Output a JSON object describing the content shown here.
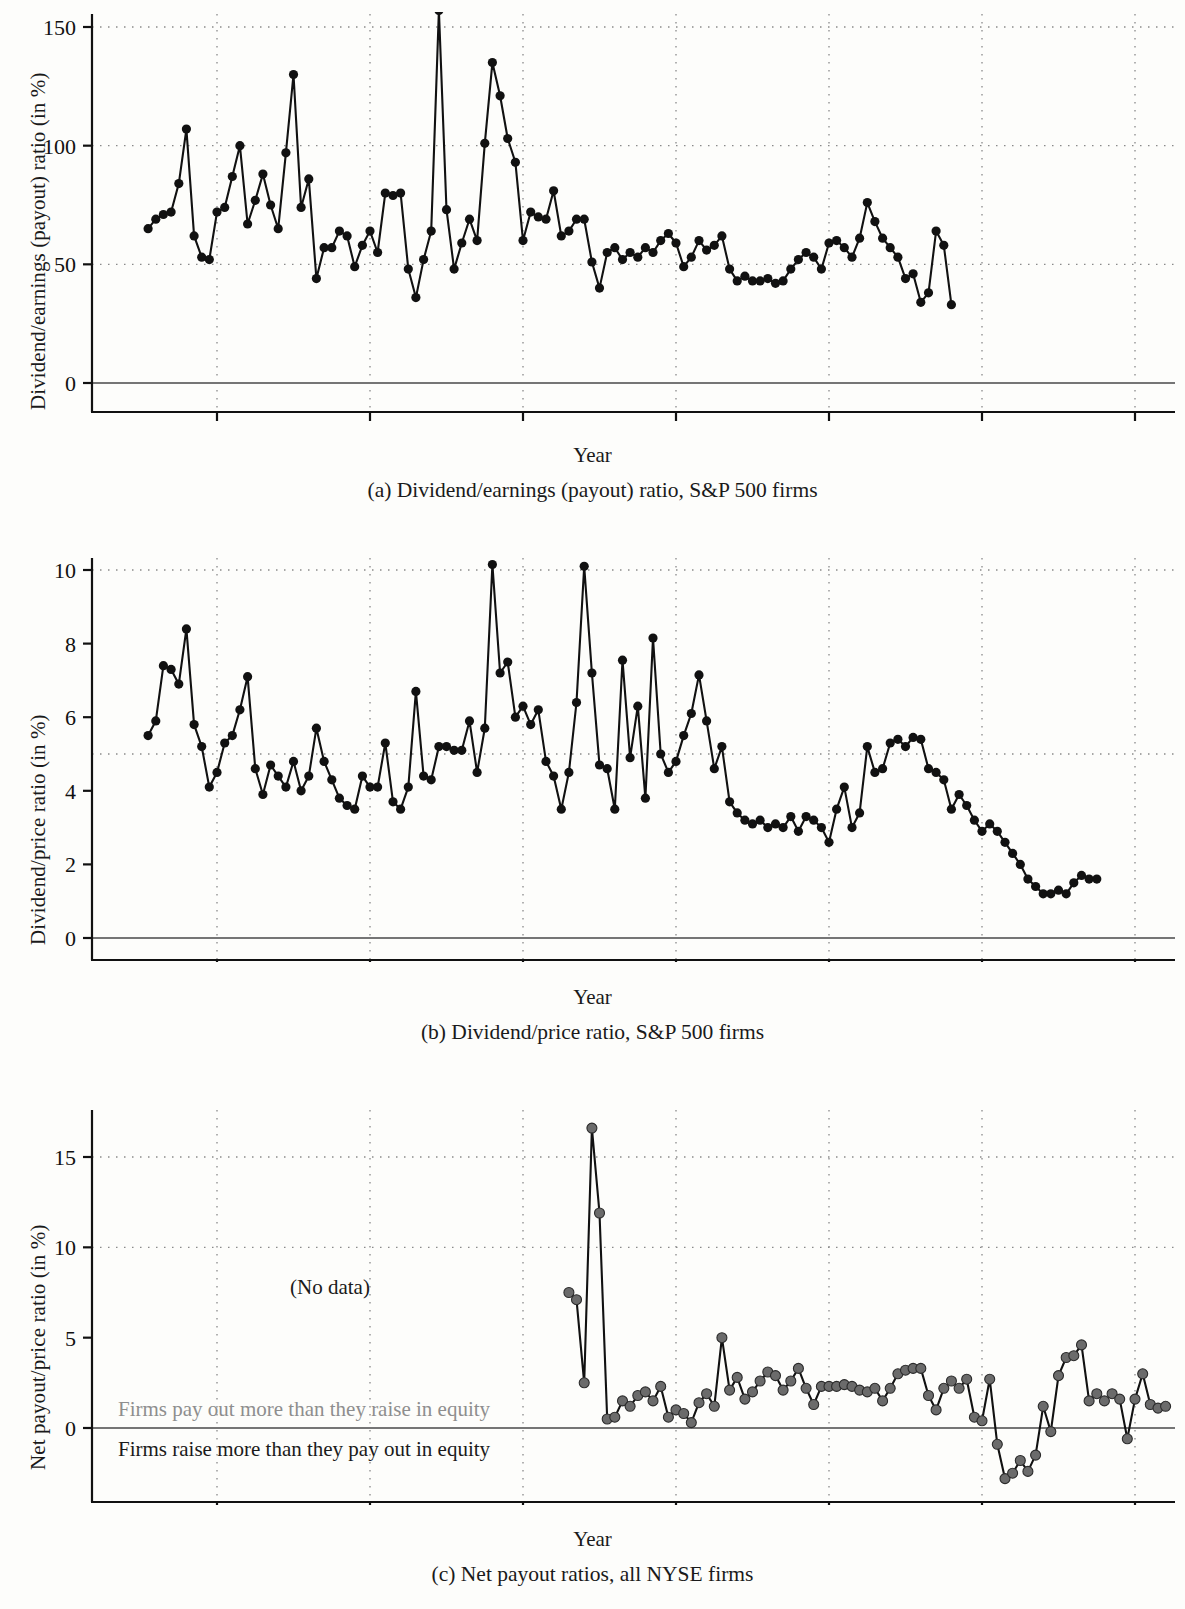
{
  "figure": {
    "panels": [
      {
        "id": "a",
        "caption": "(a) Dividend/earnings (payout) ratio, S&P 500 firms",
        "xlabel": "Year",
        "ylabel": "Dividend/earnings (payout) ratio (in %)"
      },
      {
        "id": "b",
        "caption": "(b) Dividend/price ratio, S&P 500 firms",
        "xlabel": "Year",
        "ylabel": "Dividend/price ratio (in %)"
      },
      {
        "id": "c",
        "caption": "(c) Net payout ratios, all NYSE firms",
        "xlabel": "Year",
        "ylabel": "Net payout/price ratio (in %)",
        "annotations": {
          "no_data": "(No data)",
          "above_zero": "Firms pay out more than they raise in equity",
          "below_zero": "Firms raise more than they pay out in equity"
        }
      }
    ],
    "colors": {
      "line": "#111111",
      "marker_a": "#111111",
      "marker_c": "#6b6b6b",
      "grid": "#8a8a8a",
      "zero_line": "#757575",
      "annotation_grey": "#8e8e8e"
    }
  },
  "chart_data": [
    {
      "type": "line",
      "panel": "a",
      "title": "(a) Dividend/earnings (payout) ratio, S&P 500 firms",
      "xlabel": "Year",
      "ylabel": "Dividend/earnings (payout) ratio (in %)",
      "xlim": [
        1864,
        2007
      ],
      "ylim": [
        -28,
        160
      ],
      "xticks": [
        1880,
        1900,
        1920,
        1940,
        1960,
        1980,
        2000
      ],
      "yticks": [
        0,
        50,
        100,
        150
      ],
      "grid": "dotted-both",
      "legend": "none",
      "markers": true,
      "x": [
        1871,
        1872,
        1873,
        1874,
        1875,
        1876,
        1877,
        1878,
        1879,
        1880,
        1881,
        1882,
        1883,
        1884,
        1885,
        1886,
        1887,
        1888,
        1889,
        1890,
        1891,
        1892,
        1893,
        1894,
        1895,
        1896,
        1897,
        1898,
        1899,
        1900,
        1901,
        1902,
        1903,
        1904,
        1905,
        1906,
        1907,
        1908,
        1909,
        1910,
        1911,
        1912,
        1913,
        1914,
        1915,
        1916,
        1917,
        1918,
        1919,
        1920,
        1921,
        1922,
        1923,
        1924,
        1925,
        1926,
        1927,
        1928,
        1929,
        1930,
        1931,
        1932,
        1933,
        1934,
        1935,
        1936,
        1937,
        1938,
        1939,
        1940,
        1941,
        1942,
        1943,
        1944,
        1945,
        1946,
        1947,
        1948,
        1949,
        1950,
        1951,
        1952,
        1953,
        1954,
        1955,
        1956,
        1957,
        1958,
        1959,
        1960,
        1961,
        1962,
        1963,
        1964,
        1965,
        1966,
        1967,
        1968,
        1969,
        1970,
        1971,
        1972,
        1973,
        1974,
        1975,
        1976,
        1977,
        1978,
        1979,
        1980,
        1981,
        1982,
        1983,
        1984,
        1985,
        1986,
        1987,
        1988,
        1989,
        1990,
        1991,
        1992,
        1993,
        1994,
        1995,
        1996,
        1997,
        1998,
        1999,
        2000,
        2001,
        2002,
        2003,
        2004,
        2005
      ],
      "values": [
        65,
        69,
        71,
        72,
        84,
        107,
        62,
        53,
        52,
        72,
        74,
        87,
        100,
        67,
        77,
        88,
        75,
        65,
        97,
        130,
        74,
        86,
        44,
        57,
        57,
        64,
        62,
        49,
        58,
        64,
        55,
        80,
        79,
        80,
        48,
        36,
        52,
        64,
        157,
        73,
        48,
        59,
        69,
        60,
        101,
        135,
        121,
        103,
        93,
        60,
        72,
        70,
        69,
        81,
        62,
        64,
        69,
        69,
        51,
        40,
        55,
        57,
        52,
        55,
        53,
        57,
        55,
        60,
        63,
        59,
        49,
        53,
        60,
        56,
        58,
        62,
        48,
        43,
        45,
        43,
        43,
        44,
        42,
        43,
        48,
        52,
        55,
        53,
        48,
        59,
        60,
        57,
        53,
        61,
        76,
        68,
        61,
        57,
        53,
        44,
        46,
        34,
        38,
        64,
        58,
        33
      ],
      "note": "Annual series; peak ~157 in 1909 region of plot and ~135 near 1918"
    },
    {
      "type": "line",
      "panel": "b",
      "title": "(b) Dividend/price ratio, S&P 500 firms",
      "xlabel": "Year",
      "ylabel": "Dividend/price ratio (in %)",
      "xlim": [
        1864,
        2007
      ],
      "ylim": [
        -1.7,
        10.6
      ],
      "xticks": [
        1880,
        1900,
        1920,
        1940,
        1960,
        1980,
        2000
      ],
      "yticks": [
        0,
        2,
        4,
        6,
        8,
        10
      ],
      "grid": "dotted-both",
      "legend": "none",
      "markers": true,
      "x": [
        1871,
        1872,
        1873,
        1874,
        1875,
        1876,
        1877,
        1878,
        1879,
        1880,
        1881,
        1882,
        1883,
        1884,
        1885,
        1886,
        1887,
        1888,
        1889,
        1890,
        1891,
        1892,
        1893,
        1894,
        1895,
        1896,
        1897,
        1898,
        1899,
        1900,
        1901,
        1902,
        1903,
        1904,
        1905,
        1906,
        1907,
        1908,
        1909,
        1910,
        1911,
        1912,
        1913,
        1914,
        1915,
        1916,
        1917,
        1918,
        1919,
        1920,
        1921,
        1922,
        1923,
        1924,
        1925,
        1926,
        1927,
        1928,
        1929,
        1930,
        1931,
        1932,
        1933,
        1934,
        1935,
        1936,
        1937,
        1938,
        1939,
        1940,
        1941,
        1942,
        1943,
        1944,
        1945,
        1946,
        1947,
        1948,
        1949,
        1950,
        1951,
        1952,
        1953,
        1954,
        1955,
        1956,
        1957,
        1958,
        1959,
        1960,
        1961,
        1962,
        1963,
        1964,
        1965,
        1966,
        1967,
        1968,
        1969,
        1970,
        1971,
        1972,
        1973,
        1974,
        1975,
        1976,
        1977,
        1978,
        1979,
        1980,
        1981,
        1982,
        1983,
        1984,
        1985,
        1986,
        1987,
        1988,
        1989,
        1990,
        1991,
        1992,
        1993,
        1994,
        1995,
        1996,
        1997,
        1998,
        1999,
        2000,
        2001,
        2002,
        2003,
        2004,
        2005
      ],
      "values": [
        5.5,
        5.9,
        7.4,
        7.3,
        6.9,
        8.4,
        5.8,
        5.2,
        4.1,
        4.5,
        5.3,
        5.5,
        6.2,
        7.1,
        4.6,
        3.9,
        4.7,
        4.4,
        4.1,
        4.8,
        4.0,
        4.4,
        5.7,
        4.8,
        4.3,
        3.8,
        3.6,
        3.5,
        4.4,
        4.1,
        4.1,
        5.3,
        3.7,
        3.5,
        4.1,
        6.7,
        4.4,
        4.3,
        5.2,
        5.2,
        5.1,
        5.1,
        5.9,
        4.5,
        5.7,
        10.15,
        7.2,
        7.5,
        6.0,
        6.3,
        5.8,
        6.2,
        4.8,
        4.4,
        3.5,
        4.5,
        6.4,
        10.1,
        7.2,
        4.7,
        4.6,
        3.5,
        7.55,
        4.9,
        6.3,
        3.8,
        8.15,
        5.0,
        4.5,
        4.8,
        5.5,
        6.1,
        7.15,
        5.9,
        4.6,
        5.2,
        3.7,
        3.4,
        3.2,
        3.1,
        3.2,
        3.0,
        3.1,
        3.0,
        3.3,
        2.9,
        3.3,
        3.2,
        3.0,
        2.6,
        3.5,
        4.1,
        3.0,
        3.4,
        5.2,
        4.5,
        4.6,
        5.3,
        5.4,
        5.2,
        5.45,
        5.4,
        4.6,
        4.5,
        4.3,
        3.5,
        3.9,
        3.6,
        3.2,
        2.9,
        3.1,
        2.9,
        2.6,
        2.3,
        2.0,
        1.6,
        1.4,
        1.2,
        1.2,
        1.3,
        1.2,
        1.5,
        1.7,
        1.6,
        1.6
      ],
      "note": "Annual dividend/price ratio, peaks 10.15 (1917) and 10.1 (1931), trough ~1.2 around 2000"
    },
    {
      "type": "line",
      "panel": "c",
      "title": "(c) Net payout ratios, all NYSE firms",
      "xlabel": "Year",
      "ylabel": "Net payout/price ratio (in %)",
      "xlim": [
        1864,
        2007
      ],
      "ylim": [
        -4.5,
        17.5
      ],
      "xticks": [
        1880,
        1900,
        1920,
        1940,
        1960,
        1980,
        2000
      ],
      "yticks": [
        0,
        5,
        10,
        15
      ],
      "grid": "dotted-both",
      "legend": "none",
      "markers": true,
      "data_start_year": 1926,
      "x": [
        1926,
        1927,
        1928,
        1929,
        1930,
        1931,
        1932,
        1933,
        1934,
        1935,
        1936,
        1937,
        1938,
        1939,
        1940,
        1941,
        1942,
        1943,
        1944,
        1945,
        1946,
        1947,
        1948,
        1949,
        1950,
        1951,
        1952,
        1953,
        1954,
        1955,
        1956,
        1957,
        1958,
        1959,
        1960,
        1961,
        1962,
        1963,
        1964,
        1965,
        1966,
        1967,
        1968,
        1969,
        1970,
        1971,
        1972,
        1973,
        1974,
        1975,
        1976,
        1977,
        1978,
        1979,
        1980,
        1981,
        1982,
        1983,
        1984,
        1985,
        1986,
        1987,
        1988,
        1989,
        1990,
        1991,
        1992,
        1993,
        1994,
        1995,
        1996,
        1997,
        1998,
        1999,
        2000,
        2001,
        2002,
        2003,
        2004,
        2005
      ],
      "values": [
        7.5,
        7.1,
        2.5,
        16.6,
        11.9,
        0.5,
        0.6,
        1.5,
        1.2,
        1.8,
        2.0,
        1.5,
        2.3,
        0.6,
        1.0,
        0.8,
        0.3,
        1.4,
        1.9,
        1.2,
        5.0,
        2.1,
        2.8,
        1.6,
        2.0,
        2.6,
        3.1,
        2.9,
        2.1,
        2.6,
        3.3,
        2.2,
        1.3,
        2.3,
        2.3,
        2.3,
        2.4,
        2.3,
        2.1,
        2.0,
        2.2,
        1.5,
        2.2,
        3.0,
        3.2,
        3.3,
        3.3,
        1.8,
        1.0,
        2.2,
        2.6,
        2.2,
        2.7,
        0.6,
        0.4,
        2.7,
        -0.9,
        -2.8,
        -2.5,
        -1.8,
        -2.4,
        -1.5,
        1.2,
        -0.2,
        2.9,
        3.9,
        4.0,
        4.6,
        1.5,
        1.9,
        1.5,
        1.9,
        1.6,
        -0.6,
        1.6,
        3.0,
        1.3,
        1.1,
        1.2
      ],
      "note": "No data before 1926; spike to 16.6 in 1929, negative trough ~-2.8 in the mid-1980s"
    }
  ]
}
